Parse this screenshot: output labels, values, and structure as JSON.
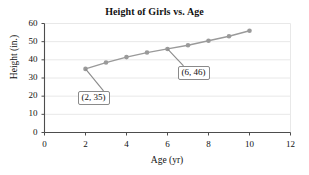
{
  "chart_data": {
    "type": "line",
    "title": "Height of Girls vs. Age",
    "xlabel": "Age (yr)",
    "ylabel": "Height (in.)",
    "xlim": [
      0,
      12
    ],
    "ylim": [
      0,
      60
    ],
    "xticks": [
      "0",
      "2",
      "4",
      "6",
      "8",
      "10",
      "12"
    ],
    "yticks": [
      "0",
      "10",
      "20",
      "30",
      "40",
      "50",
      "60"
    ],
    "grid": "horizontal",
    "legend": "none",
    "series": [
      {
        "name": "Height of girls",
        "color": "#9a9a9a",
        "marker": "circle",
        "x": [
          2,
          3,
          4,
          5,
          6,
          7,
          8,
          9,
          10
        ],
        "values": [
          35,
          38.5,
          41.5,
          44,
          46,
          48,
          50.5,
          53,
          56
        ]
      }
    ],
    "annotations": [
      {
        "label": "(2, 35)",
        "point_x": 2,
        "point_y": 35
      },
      {
        "label": "(6, 46)",
        "point_x": 6,
        "point_y": 46
      }
    ]
  }
}
